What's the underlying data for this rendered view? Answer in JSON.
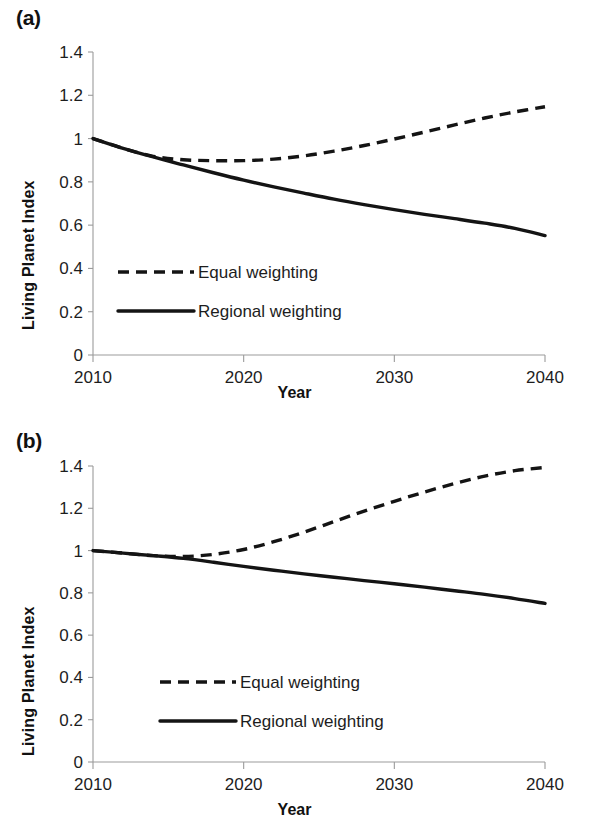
{
  "figure": {
    "panels": [
      {
        "id": "a",
        "label": "(a)",
        "xlabel": "Year",
        "ylabel": "Living Planet Index"
      },
      {
        "id": "b",
        "label": "(b)",
        "xlabel": "Year",
        "ylabel": "Living Planet Index"
      }
    ]
  },
  "chart_data": [
    {
      "type": "line",
      "panel": "(a)",
      "title": "",
      "xlabel": "Year",
      "ylabel": "Living Planet Index",
      "xlim": [
        2010,
        2040
      ],
      "ylim": [
        0,
        1.4
      ],
      "xticks": [
        2010,
        2020,
        2030,
        2040
      ],
      "xtick_labels": [
        "2010",
        "2020",
        "2030",
        "2040"
      ],
      "yticks": [
        0,
        0.2,
        0.4,
        0.6,
        0.8,
        1,
        1.2,
        1.4
      ],
      "ytick_labels": [
        "0",
        "0.2",
        "0.4",
        "0.6",
        "0.8",
        "1",
        "1.2",
        "1.4"
      ],
      "grid": false,
      "legend_position": "center-left",
      "x": [
        2010,
        2012,
        2014,
        2016,
        2018,
        2020,
        2022,
        2024,
        2026,
        2028,
        2030,
        2032,
        2034,
        2036,
        2038,
        2040
      ],
      "series": [
        {
          "name": "Equal weighting",
          "style": "dashed",
          "color": "#141414",
          "values": [
            1.0,
            0.955,
            0.918,
            0.902,
            0.898,
            0.898,
            0.905,
            0.92,
            0.942,
            0.968,
            0.998,
            1.03,
            1.063,
            1.095,
            1.123,
            1.147
          ]
        },
        {
          "name": "Regional weighting",
          "style": "solid",
          "color": "#141414",
          "values": [
            1.0,
            0.955,
            0.915,
            0.878,
            0.842,
            0.808,
            0.777,
            0.748,
            0.72,
            0.695,
            0.672,
            0.65,
            0.63,
            0.609,
            0.585,
            0.552
          ]
        }
      ]
    },
    {
      "type": "line",
      "panel": "(b)",
      "title": "",
      "xlabel": "Year",
      "ylabel": "Living Planet Index",
      "xlim": [
        2010,
        2040
      ],
      "ylim": [
        0,
        1.4
      ],
      "xticks": [
        2010,
        2020,
        2030,
        2040
      ],
      "xtick_labels": [
        "2010",
        "2020",
        "2030",
        "2040"
      ],
      "yticks": [
        0,
        0.2,
        0.4,
        0.6,
        0.8,
        1,
        1.2,
        1.4
      ],
      "ytick_labels": [
        "0",
        "0.2",
        "0.4",
        "0.6",
        "0.8",
        "1",
        "1.2",
        "1.4"
      ],
      "grid": false,
      "legend_position": "center-left",
      "x": [
        2010,
        2012,
        2014,
        2016,
        2018,
        2020,
        2022,
        2024,
        2026,
        2028,
        2030,
        2032,
        2034,
        2036,
        2038,
        2040
      ],
      "series": [
        {
          "name": "Equal weighting",
          "style": "dashed",
          "color": "#141414",
          "values": [
            1.0,
            0.988,
            0.976,
            0.972,
            0.982,
            1.005,
            1.042,
            1.087,
            1.137,
            1.187,
            1.233,
            1.277,
            1.317,
            1.352,
            1.378,
            1.393
          ]
        },
        {
          "name": "Regional weighting",
          "style": "solid",
          "color": "#141414",
          "values": [
            1.0,
            0.988,
            0.976,
            0.963,
            0.945,
            0.925,
            0.907,
            0.89,
            0.874,
            0.858,
            0.843,
            0.827,
            0.81,
            0.793,
            0.773,
            0.75
          ]
        }
      ]
    }
  ],
  "legend": {
    "equal_label": "Equal weighting",
    "regional_label": "Regional weighting"
  },
  "axis_titles": {
    "x": "Year",
    "y": "Living Planet Index"
  },
  "tick_labels": {
    "y": [
      "1.4",
      "1.2",
      "1",
      "0.8",
      "0.6",
      "0.4",
      "0.2",
      "0"
    ],
    "x": [
      "2010",
      "2020",
      "2030",
      "2040"
    ]
  },
  "colors": {
    "series": "#141414",
    "axis": "#9b9b9b",
    "text": "#1d1d1d",
    "background": "#ffffff"
  }
}
